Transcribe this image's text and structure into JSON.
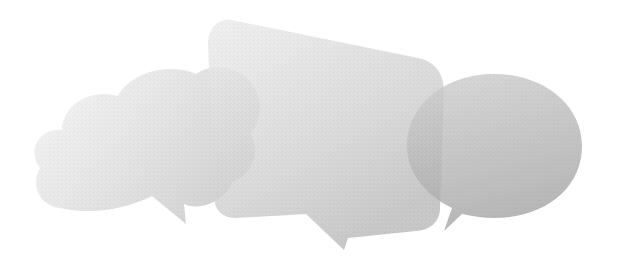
{
  "image": {
    "description": "Three overlapping translucent gray speech bubbles on a white background",
    "background_color": "#ffffff",
    "bubbles": [
      {
        "id": "left",
        "shape": "cloud",
        "color_light": "#f4f4f4",
        "color_dark": "#c9c9c9",
        "opacity": 0.72
      },
      {
        "id": "middle",
        "shape": "rounded-rectangle",
        "color_light": "#ededed",
        "color_dark": "#bdbdbd",
        "opacity": 0.78
      },
      {
        "id": "right",
        "shape": "ellipse",
        "color_light": "#cfcfcf",
        "color_dark": "#a9a9a9",
        "opacity": 0.82
      }
    ]
  }
}
